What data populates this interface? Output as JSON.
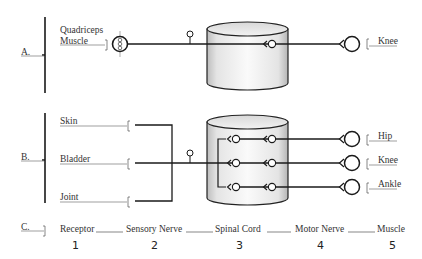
{
  "diagram": {
    "panels": {
      "A": {
        "label": "A.",
        "receptor_label_line1": "Quadriceps",
        "receptor_label_line2": "Muscle",
        "effector_label": "Knee"
      },
      "B": {
        "label": "B.",
        "receptors": [
          "Skin",
          "Bladder",
          "Joint"
        ],
        "effectors": [
          "Hip",
          "Knee",
          "Ankle"
        ]
      },
      "C": {
        "label": "C.",
        "stages": [
          {
            "name": "Receptor",
            "number": "1"
          },
          {
            "name": "Sensory Nerve",
            "number": "2"
          },
          {
            "name": "Spinal Cord",
            "number": "3"
          },
          {
            "name": "Motor Nerve",
            "number": "4"
          },
          {
            "name": "Muscle",
            "number": "5"
          }
        ]
      }
    },
    "colors": {
      "line": "#1a1a1a",
      "thin_line": "#777777",
      "text": "#333333",
      "cylinder_fill": "#e6e6e6"
    }
  }
}
